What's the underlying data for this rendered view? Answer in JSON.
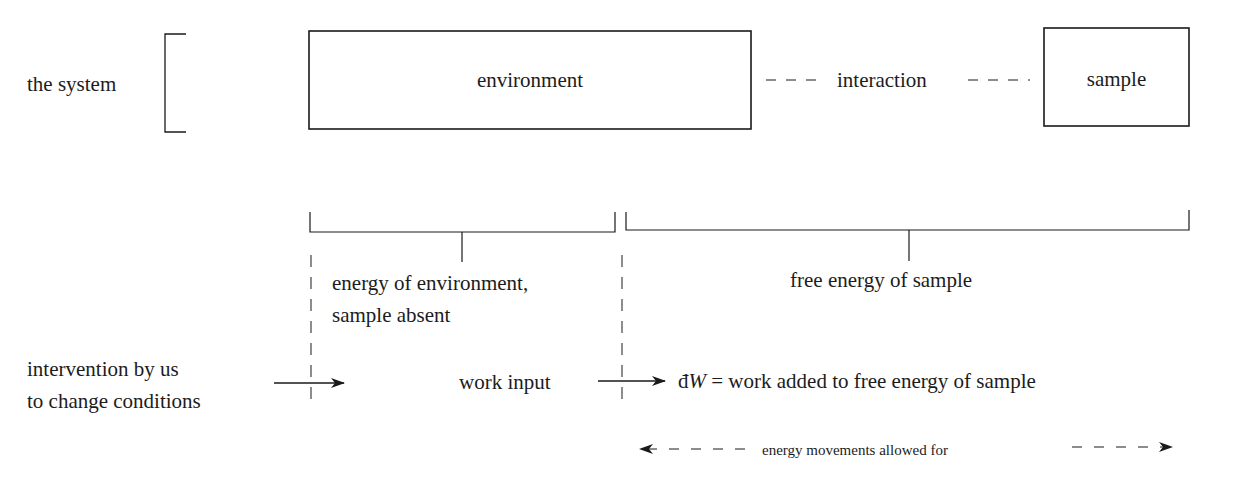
{
  "diagram": {
    "system_label": "the system",
    "boxes": {
      "environment": "environment",
      "sample": "sample"
    },
    "interaction_label": "interaction",
    "brackets": {
      "environment_energy": {
        "line1": "energy of environment,",
        "line2": "sample absent"
      },
      "sample_free_energy": "free energy of sample"
    },
    "intervention": {
      "line1": "intervention by us",
      "line2": "to change conditions"
    },
    "work_input_label": "work input",
    "work_result": {
      "symbol": "đ",
      "variable": "W",
      "text": " = work added to free energy of sample"
    },
    "legend": {
      "label": "energy movements allowed for"
    },
    "colors": {
      "line": "#1a1a1a",
      "background": "#ffffff"
    }
  }
}
